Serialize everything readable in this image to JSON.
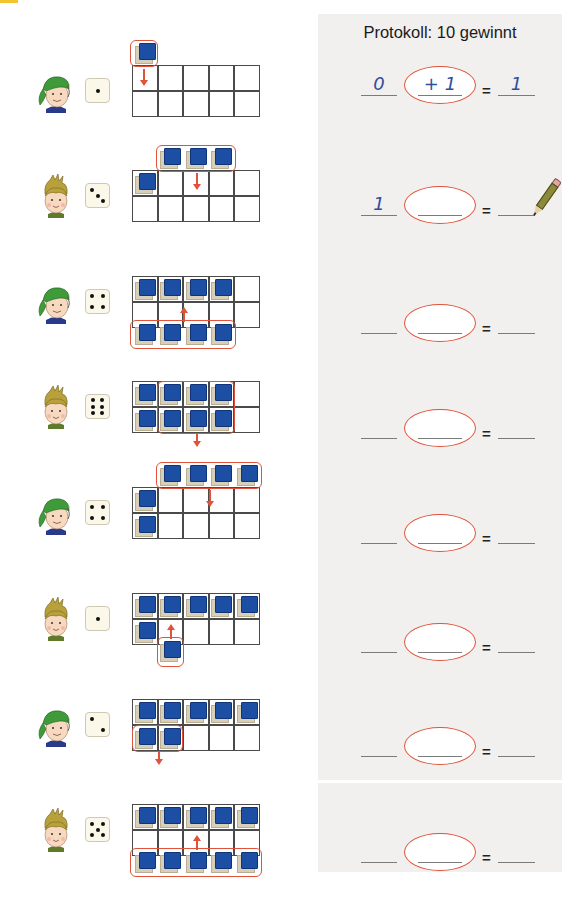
{
  "header": {
    "tab_color": "#f4c430"
  },
  "panel": {
    "title": "Protokoll: 10 gewinnt",
    "background": "#f1f0ee"
  },
  "colors": {
    "cube_face": "#1c4fa3",
    "cube_side": "#d8cfb8",
    "highlight": "#e0533a",
    "handwriting": "#2e4f9e"
  },
  "rows": [
    {
      "player": "boy-with-green-cap",
      "die": 1,
      "grid_top": 65,
      "filled": [],
      "group": {
        "cells": "above-col1",
        "count": 1,
        "direction": "down"
      },
      "equation": {
        "start": "0",
        "change": "+ 1",
        "result": "1"
      }
    },
    {
      "player": "girl-with-bun",
      "die": 3,
      "grid_top": 170,
      "filled": [
        [
          0,
          0
        ]
      ],
      "group": {
        "cells": "above-col2-4",
        "count": 3,
        "direction": "down"
      },
      "equation": {
        "start": "1",
        "change": "",
        "result": ""
      },
      "pencil": true
    },
    {
      "player": "boy-with-green-cap",
      "die": 4,
      "grid_top": 276,
      "filled": [
        [
          0,
          0
        ],
        [
          0,
          1
        ],
        [
          0,
          2
        ],
        [
          0,
          3
        ]
      ],
      "group": {
        "cells": "below-col1-4",
        "count": 4,
        "direction": "up"
      },
      "equation": {
        "start": "",
        "change": "",
        "result": ""
      }
    },
    {
      "player": "girl-with-bun",
      "die": 6,
      "grid_top": 381,
      "filled": [
        [
          0,
          0
        ],
        [
          0,
          1
        ],
        [
          0,
          2
        ],
        [
          0,
          3
        ],
        [
          1,
          0
        ],
        [
          1,
          1
        ],
        [
          1,
          2
        ],
        [
          1,
          3
        ]
      ],
      "group": {
        "cells": "inside-col2-4-both-rows",
        "count": 6,
        "direction": "down"
      },
      "equation": {
        "start": "",
        "change": "",
        "result": ""
      }
    },
    {
      "player": "boy-with-green-cap",
      "die": 4,
      "grid_top": 487,
      "filled": [
        [
          0,
          0
        ],
        [
          1,
          0
        ]
      ],
      "group": {
        "cells": "above-col2-5",
        "count": 4,
        "direction": "down"
      },
      "equation": {
        "start": "",
        "change": "",
        "result": ""
      }
    },
    {
      "player": "girl-with-bun",
      "die": 1,
      "grid_top": 593,
      "filled": [
        [
          0,
          0
        ],
        [
          0,
          1
        ],
        [
          0,
          2
        ],
        [
          0,
          3
        ],
        [
          0,
          4
        ],
        [
          1,
          0
        ]
      ],
      "group": {
        "cells": "below-col2",
        "count": 1,
        "direction": "up"
      },
      "equation": {
        "start": "",
        "change": "",
        "result": ""
      }
    },
    {
      "player": "boy-with-green-cap",
      "die": 2,
      "grid_top": 699,
      "filled": [
        [
          0,
          0
        ],
        [
          0,
          1
        ],
        [
          0,
          2
        ],
        [
          0,
          3
        ],
        [
          0,
          4
        ],
        [
          1,
          0
        ],
        [
          1,
          1
        ]
      ],
      "group": {
        "cells": "inside-row2-col1-2",
        "count": 2,
        "direction": "down"
      },
      "equation": {
        "start": "",
        "change": "",
        "result": ""
      }
    },
    {
      "player": "girl-with-bun",
      "die": 5,
      "grid_top": 804,
      "filled": [
        [
          0,
          0
        ],
        [
          0,
          1
        ],
        [
          0,
          2
        ],
        [
          0,
          3
        ],
        [
          0,
          4
        ]
      ],
      "group": {
        "cells": "below-col1-5",
        "count": 5,
        "direction": "up"
      },
      "equation": {
        "start": "",
        "change": "",
        "result": ""
      }
    }
  ],
  "equation_tops": [
    52,
    172,
    290,
    395,
    500,
    609,
    713,
    819
  ],
  "equals_sign": "="
}
